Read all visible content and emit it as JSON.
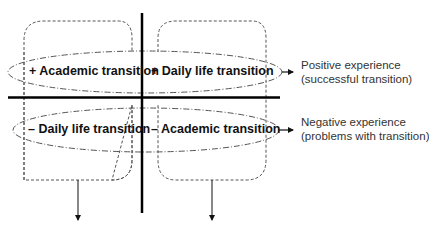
{
  "diagram": {
    "quadrants": {
      "top_left": "+ Academic transition",
      "top_right": "+ Daily life transition",
      "bottom_left": "– Daily life transition",
      "bottom_right": "– Academic transition"
    },
    "outcomes": {
      "positive": {
        "line1": "Positive experience",
        "line2": "(successful transition)"
      },
      "negative": {
        "line1": "Negative experience",
        "line2": "(problems with transition)"
      }
    },
    "colors": {
      "axis": "#000000",
      "dashed": "#555555",
      "text": "#111111",
      "outcome_text": "#333333"
    }
  }
}
